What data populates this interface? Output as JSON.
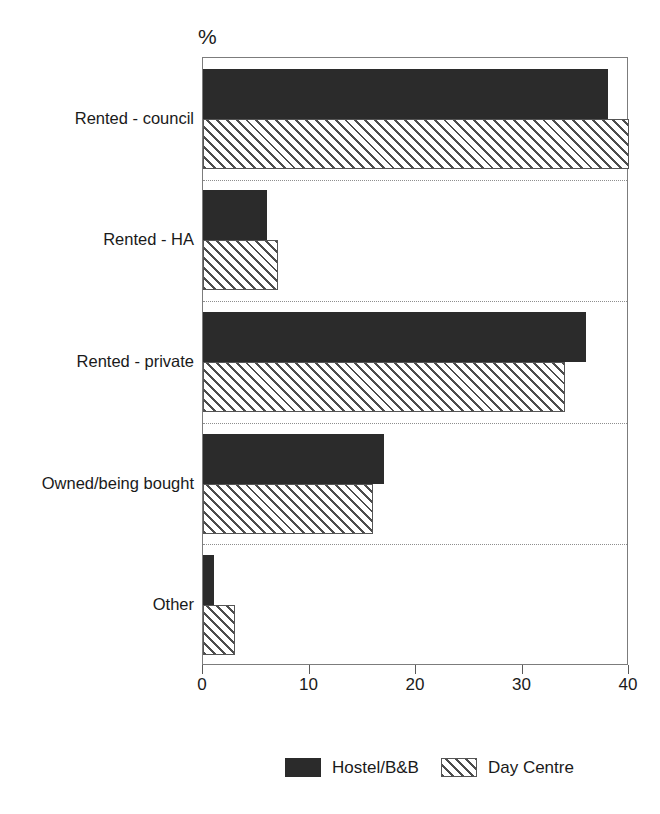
{
  "chart_data": {
    "type": "bar",
    "orientation": "horizontal",
    "title": "",
    "xlabel": "",
    "ylabel": "",
    "unit_label": "%",
    "categories": [
      "Rented - council",
      "Rented - HA",
      "Rented - private",
      "Owned/being bought",
      "Other"
    ],
    "series": [
      {
        "name": "Hostel/B&B",
        "pattern": "solid",
        "color": "#2b2b2b",
        "values": [
          38,
          6,
          36,
          17,
          1
        ]
      },
      {
        "name": "Day Centre",
        "pattern": "hatched",
        "color": "#ffffff",
        "values": [
          40,
          7,
          34,
          16,
          3
        ]
      }
    ],
    "xlim": [
      0,
      40
    ],
    "xticks": [
      0,
      10,
      20,
      30,
      40
    ],
    "xtick_labels": [
      "0",
      "10",
      "20",
      "30",
      "40"
    ],
    "grid": "dotted horizontal separators between categories",
    "legend_position": "bottom-center"
  },
  "legend": {
    "items": [
      {
        "label": "Hostel/B&B",
        "pattern": "solid"
      },
      {
        "label": "Day Centre",
        "pattern": "hatched"
      }
    ]
  },
  "colors": {
    "bar_solid": "#2b2b2b",
    "bar_hatch_line": "#4d4d4d",
    "frame": "#7c7c7c",
    "separator": "#8e8e8e",
    "text": "#1a1a1a"
  }
}
